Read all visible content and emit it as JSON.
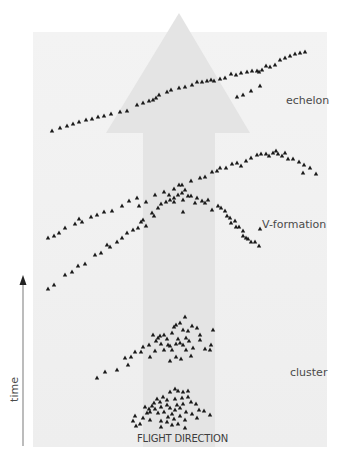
{
  "diagram": {
    "title_fragment": "",
    "colors": {
      "background": "#ffffff",
      "panel": "#f1f1f1",
      "flight_arrow": "#e2e2e2",
      "bird_marker": "#1a1a1a",
      "axis": "#9a9a9a",
      "axis_head": "#222222",
      "text": "#4a4a4a"
    },
    "labels": {
      "echelon": "echelon",
      "v_formation": "V-formation",
      "cluster": "cluster",
      "flight_direction": "FLIGHT DIRECTION",
      "time_axis": "time"
    },
    "marker_icon": "triangle-bird-icon",
    "formations": [
      {
        "name": "echelon",
        "points": [
          [
            52,
            131
          ],
          [
            60,
            128
          ],
          [
            67,
            126
          ],
          [
            73,
            124
          ],
          [
            79,
            122
          ],
          [
            86,
            120
          ],
          [
            92,
            119
          ],
          [
            98,
            117
          ],
          [
            104,
            116
          ],
          [
            111,
            114
          ],
          [
            120,
            112
          ],
          [
            127,
            111
          ],
          [
            137,
            105
          ],
          [
            143,
            103
          ],
          [
            149,
            101
          ],
          [
            153,
            100
          ],
          [
            156,
            98
          ],
          [
            159,
            95
          ],
          [
            167,
            92
          ],
          [
            171,
            90
          ],
          [
            179,
            88
          ],
          [
            185,
            87
          ],
          [
            192,
            85
          ],
          [
            197,
            82
          ],
          [
            202,
            82
          ],
          [
            207,
            81
          ],
          [
            211,
            80
          ],
          [
            214,
            81
          ],
          [
            220,
            79
          ],
          [
            225,
            78
          ],
          [
            231,
            74
          ],
          [
            236,
            75
          ],
          [
            241,
            73
          ],
          [
            247,
            72
          ],
          [
            252,
            71
          ],
          [
            257,
            71
          ],
          [
            259,
            72
          ],
          [
            262,
            70
          ],
          [
            266,
            66
          ],
          [
            270,
            67
          ],
          [
            275,
            65
          ],
          [
            280,
            60
          ],
          [
            285,
            58
          ],
          [
            290,
            56
          ],
          [
            295,
            54
          ],
          [
            300,
            53
          ],
          [
            305,
            52
          ],
          [
            237,
            97
          ],
          [
            243,
            95
          ],
          [
            251,
            91
          ],
          [
            260,
            86
          ]
        ]
      },
      {
        "name": "v-formation-wide",
        "points": [
          [
            48,
            238
          ],
          [
            54,
            236
          ],
          [
            59,
            233
          ],
          [
            65,
            228
          ],
          [
            75,
            224
          ],
          [
            79,
            219
          ],
          [
            82,
            222
          ],
          [
            91,
            217
          ],
          [
            97,
            215
          ],
          [
            104,
            212
          ],
          [
            112,
            211
          ],
          [
            122,
            206
          ],
          [
            129,
            201
          ],
          [
            137,
            198
          ],
          [
            139,
            206
          ],
          [
            146,
            202
          ],
          [
            155,
            195
          ],
          [
            164,
            192
          ],
          [
            169,
            195
          ],
          [
            174,
            189
          ],
          [
            179,
            185
          ],
          [
            182,
            185
          ],
          [
            185,
            190
          ],
          [
            191,
            181
          ],
          [
            200,
            178
          ],
          [
            205,
            177
          ],
          [
            212,
            172
          ],
          [
            217,
            171
          ],
          [
            220,
            168
          ],
          [
            226,
            168
          ],
          [
            232,
            164
          ],
          [
            237,
            163
          ],
          [
            241,
            166
          ],
          [
            246,
            161
          ],
          [
            251,
            158
          ],
          [
            257,
            155
          ],
          [
            261,
            154
          ],
          [
            266,
            154
          ],
          [
            269,
            156
          ],
          [
            273,
            153
          ],
          [
            276,
            151
          ],
          [
            278,
            154
          ],
          [
            282,
            156
          ],
          [
            285,
            153
          ],
          [
            288,
            159
          ],
          [
            293,
            159
          ],
          [
            299,
            162
          ],
          [
            304,
            165
          ],
          [
            303,
            173
          ],
          [
            310,
            168
          ],
          [
            316,
            174
          ]
        ]
      },
      {
        "name": "v-formation-lower",
        "points": [
          [
            48,
            289
          ],
          [
            54,
            285
          ],
          [
            65,
            275
          ],
          [
            72,
            272
          ],
          [
            78,
            266
          ],
          [
            85,
            264
          ],
          [
            95,
            255
          ],
          [
            101,
            253
          ],
          [
            107,
            245
          ],
          [
            110,
            247
          ],
          [
            117,
            242
          ],
          [
            122,
            238
          ],
          [
            127,
            233
          ],
          [
            133,
            230
          ],
          [
            138,
            228
          ],
          [
            141,
            222
          ],
          [
            143,
            220
          ],
          [
            146,
            226
          ],
          [
            152,
            213
          ],
          [
            154,
            216
          ],
          [
            158,
            208
          ],
          [
            161,
            204
          ],
          [
            166,
            202
          ],
          [
            170,
            200
          ],
          [
            174,
            198
          ],
          [
            178,
            195
          ],
          [
            174,
            202
          ],
          [
            182,
            193
          ],
          [
            188,
            196
          ],
          [
            183,
            200
          ],
          [
            183,
            212
          ],
          [
            191,
            196
          ],
          [
            195,
            203
          ],
          [
            197,
            198
          ],
          [
            202,
            201
          ],
          [
            205,
            203
          ],
          [
            212,
            210
          ],
          [
            208,
            200
          ],
          [
            218,
            206
          ],
          [
            221,
            208
          ],
          [
            225,
            211
          ],
          [
            227,
            216
          ],
          [
            230,
            218
          ],
          [
            231,
            223
          ],
          [
            235,
            221
          ],
          [
            236,
            227
          ],
          [
            239,
            227
          ],
          [
            243,
            231
          ],
          [
            243,
            236
          ],
          [
            246,
            238
          ],
          [
            248,
            239
          ],
          [
            251,
            242
          ],
          [
            255,
            242
          ],
          [
            259,
            246
          ],
          [
            260,
            229
          ]
        ]
      },
      {
        "name": "cluster-upper",
        "points": [
          [
            97,
            378
          ],
          [
            105,
            372
          ],
          [
            117,
            370
          ],
          [
            128,
            365
          ],
          [
            131,
            357
          ],
          [
            125,
            358
          ],
          [
            135,
            352
          ],
          [
            141,
            352
          ],
          [
            143,
            347
          ],
          [
            149,
            345
          ],
          [
            153,
            335
          ],
          [
            156,
            341
          ],
          [
            158,
            338
          ],
          [
            160,
            336
          ],
          [
            164,
            335
          ],
          [
            167,
            339
          ],
          [
            172,
            333
          ],
          [
            174,
            327
          ],
          [
            176,
            325
          ],
          [
            180,
            323
          ],
          [
            183,
            330
          ],
          [
            185,
            317
          ],
          [
            150,
            357
          ],
          [
            155,
            351
          ],
          [
            161,
            344
          ],
          [
            164,
            350
          ],
          [
            168,
            345
          ],
          [
            170,
            346
          ],
          [
            172,
            350
          ],
          [
            176,
            344
          ],
          [
            178,
            339
          ],
          [
            180,
            343
          ],
          [
            183,
            345
          ],
          [
            186,
            338
          ],
          [
            188,
            331
          ],
          [
            192,
            326
          ],
          [
            197,
            328
          ],
          [
            200,
            335
          ],
          [
            200,
            340
          ],
          [
            205,
            349
          ],
          [
            210,
            350
          ],
          [
            213,
            330
          ],
          [
            211,
            345
          ],
          [
            191,
            356
          ],
          [
            176,
            357
          ],
          [
            170,
            361
          ],
          [
            181,
            359
          ],
          [
            186,
            350
          ],
          [
            193,
            348
          ],
          [
            189,
            341
          ]
        ]
      },
      {
        "name": "cluster-lower",
        "points": [
          [
            135,
            416
          ],
          [
            133,
            421
          ],
          [
            136,
            426
          ],
          [
            143,
            418
          ],
          [
            147,
            413
          ],
          [
            149,
            409
          ],
          [
            152,
            406
          ],
          [
            154,
            403
          ],
          [
            157,
            399
          ],
          [
            160,
            402
          ],
          [
            163,
            397
          ],
          [
            167,
            400
          ],
          [
            170,
            392
          ],
          [
            175,
            389
          ],
          [
            178,
            391
          ],
          [
            183,
            392
          ],
          [
            188,
            391
          ],
          [
            191,
            402
          ],
          [
            196,
            404
          ],
          [
            199,
            410
          ],
          [
            204,
            411
          ],
          [
            210,
            415
          ],
          [
            145,
            407
          ],
          [
            150,
            412
          ],
          [
            155,
            409
          ],
          [
            158,
            413
          ],
          [
            161,
            407
          ],
          [
            164,
            412
          ],
          [
            167,
            405
          ],
          [
            170,
            408
          ],
          [
            172,
            414
          ],
          [
            175,
            410
          ],
          [
            177,
            405
          ],
          [
            180,
            408
          ],
          [
            183,
            404
          ],
          [
            186,
            412
          ],
          [
            180,
            416
          ],
          [
            174,
            419
          ],
          [
            167,
            422
          ],
          [
            161,
            421
          ],
          [
            178,
            424
          ],
          [
            185,
            420
          ],
          [
            192,
            414
          ],
          [
            197,
            418
          ],
          [
            185,
            428
          ],
          [
            172,
            425
          ],
          [
            150,
            420
          ],
          [
            140,
            424
          ],
          [
            161,
            427
          ],
          [
            168,
            417
          ],
          [
            175,
            399
          ],
          [
            182,
            398
          ],
          [
            188,
            397
          ]
        ]
      }
    ]
  }
}
